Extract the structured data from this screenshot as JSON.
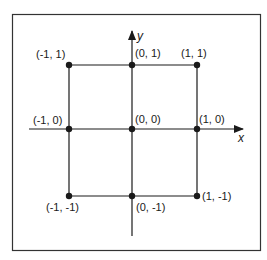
{
  "diagram": {
    "type": "coordinate-grid",
    "axes": {
      "x_label": "x",
      "y_label": "y"
    },
    "points": [
      {
        "x": -1,
        "y": 1,
        "label": "(-1, 1)"
      },
      {
        "x": 0,
        "y": 1,
        "label": "(0, 1)"
      },
      {
        "x": 1,
        "y": 1,
        "label": "(1, 1)"
      },
      {
        "x": -1,
        "y": 0,
        "label": "(-1, 0)"
      },
      {
        "x": 0,
        "y": 0,
        "label": "(0, 0)"
      },
      {
        "x": 1,
        "y": 0,
        "label": "(1, 0)"
      },
      {
        "x": -1,
        "y": -1,
        "label": "(-1, -1)"
      },
      {
        "x": 0,
        "y": -1,
        "label": "(0, -1)"
      },
      {
        "x": 1,
        "y": -1,
        "label": "(1, -1)"
      }
    ],
    "square": {
      "corners": [
        [
          -1,
          1
        ],
        [
          1,
          1
        ],
        [
          1,
          -1
        ],
        [
          -1,
          -1
        ]
      ]
    },
    "colors": {
      "ink": "#1a1a1a",
      "frame": "#333333",
      "background": "#ffffff"
    }
  }
}
